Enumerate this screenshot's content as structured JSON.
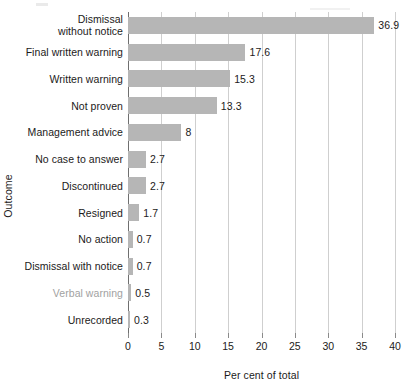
{
  "chart_data": {
    "type": "bar",
    "orientation": "horizontal",
    "title": "",
    "subtitle": "",
    "xlabel": "Per cent of total",
    "ylabel": "Outcome",
    "xlim": [
      0,
      40
    ],
    "ylim": null,
    "grid": true,
    "legend": null,
    "legend_position": "none",
    "xticks": [
      "0",
      "5",
      "10",
      "15",
      "20",
      "25",
      "30",
      "35",
      "40"
    ],
    "xtick_values": [
      0,
      5,
      10,
      15,
      20,
      25,
      30,
      35,
      40
    ],
    "bar_color": "#b6b6b6",
    "axis_color": "#6f6f6f",
    "gridline_color": "#cfcfcf",
    "text_color": "#1c1a1a",
    "categories": [
      "Dismissal without notice",
      "Final written warning",
      "Written warning",
      "Not proven",
      "Management advice",
      "No case to answer",
      "Discontinued",
      "Resigned",
      "No action",
      "Dismissal with notice",
      "Verbal warning",
      "Unrecorded"
    ],
    "values": [
      36.9,
      17.6,
      15.3,
      13.3,
      8,
      2.7,
      2.7,
      1.7,
      0.7,
      0.7,
      0.5,
      0.3
    ],
    "value_labels": [
      "36.9",
      "17.6",
      "15.3",
      "13.3",
      "8",
      "2.7",
      "2.7",
      "1.7",
      "0.7",
      "0.7",
      "0.5",
      "0.3"
    ],
    "bars": [
      {
        "label": "Dismissal without notice",
        "label_lines": [
          "Dismissal",
          "without notice"
        ],
        "value": 36.9,
        "value_label": "36.9",
        "faded": false
      },
      {
        "label": "Final written warning",
        "label_lines": [
          "Final written warning"
        ],
        "value": 17.6,
        "value_label": "17.6",
        "faded": false
      },
      {
        "label": "Written warning",
        "label_lines": [
          "Written warning"
        ],
        "value": 15.3,
        "value_label": "15.3",
        "faded": false
      },
      {
        "label": "Not proven",
        "label_lines": [
          "Not proven"
        ],
        "value": 13.3,
        "value_label": "13.3",
        "faded": false
      },
      {
        "label": "Management advice",
        "label_lines": [
          "Management advice"
        ],
        "value": 8,
        "value_label": "8",
        "faded": false
      },
      {
        "label": "No case to answer",
        "label_lines": [
          "No case to answer"
        ],
        "value": 2.7,
        "value_label": "2.7",
        "faded": false
      },
      {
        "label": "Discontinued",
        "label_lines": [
          "Discontinued"
        ],
        "value": 2.7,
        "value_label": "2.7",
        "faded": false
      },
      {
        "label": "Resigned",
        "label_lines": [
          "Resigned"
        ],
        "value": 1.7,
        "value_label": "1.7",
        "faded": false
      },
      {
        "label": "No action",
        "label_lines": [
          "No action"
        ],
        "value": 0.7,
        "value_label": "0.7",
        "faded": false
      },
      {
        "label": "Dismissal with notice",
        "label_lines": [
          "Dismissal with notice"
        ],
        "value": 0.7,
        "value_label": "0.7",
        "faded": false
      },
      {
        "label": "Verbal warning",
        "label_lines": [
          "Verbal warning"
        ],
        "value": 0.5,
        "value_label": "0.5",
        "faded": true
      },
      {
        "label": "Unrecorded",
        "label_lines": [
          "Unrecorded"
        ],
        "value": 0.3,
        "value_label": "0.3",
        "faded": false
      }
    ]
  }
}
